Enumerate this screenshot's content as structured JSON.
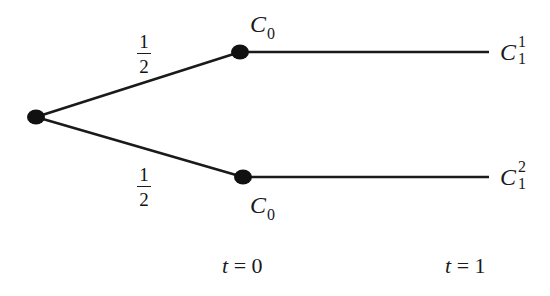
{
  "diagram": {
    "type": "event-tree",
    "colors": {
      "line": "#1a1a1a",
      "node": "#111111",
      "background": "#ffffff"
    },
    "nodes": [
      {
        "id": "root",
        "x": 36,
        "y": 117
      },
      {
        "id": "upper",
        "x": 240,
        "y": 52,
        "label_var": "C",
        "label_sub": "0"
      },
      {
        "id": "lower",
        "x": 243,
        "y": 177,
        "label_var": "C",
        "label_sub": "0"
      },
      {
        "id": "upper-end",
        "x": 489,
        "y": 52,
        "label_var": "C",
        "label_sub": "1",
        "label_sup": "1"
      },
      {
        "id": "lower-end",
        "x": 489,
        "y": 177,
        "label_var": "C",
        "label_sub": "1",
        "label_sup": "2"
      }
    ],
    "edges": [
      {
        "from": "root",
        "to": "upper",
        "prob_num": "1",
        "prob_den": "2"
      },
      {
        "from": "root",
        "to": "lower",
        "prob_num": "1",
        "prob_den": "2"
      },
      {
        "from": "upper",
        "to": "upper-end"
      },
      {
        "from": "lower",
        "to": "lower-end"
      }
    ],
    "time_labels": [
      {
        "var": "t",
        "text": " = 0"
      },
      {
        "var": "t",
        "text": " = 1"
      }
    ]
  }
}
